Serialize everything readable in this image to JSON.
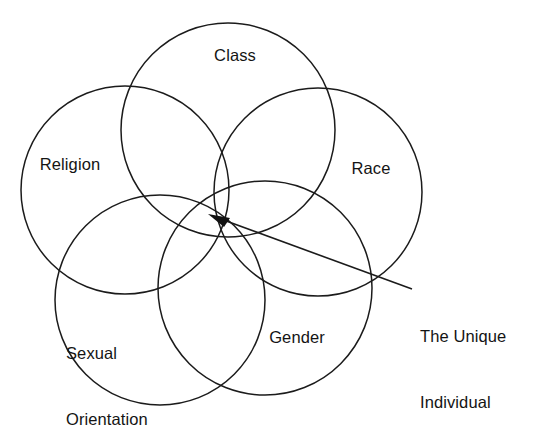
{
  "diagram": {
    "type": "venn",
    "title": "",
    "background_color": "#ffffff",
    "stroke_color": "#1b1b1b",
    "text_color": "#141414",
    "canvas": {
      "width": 549,
      "height": 426
    },
    "circles": [
      {
        "id": "religion",
        "label": "Religion",
        "cx": 125,
        "cy": 190,
        "r": 104
      },
      {
        "id": "class",
        "label": "Class",
        "cx": 228,
        "cy": 130,
        "r": 107
      },
      {
        "id": "race",
        "label": "Race",
        "cx": 318,
        "cy": 192,
        "r": 104
      },
      {
        "id": "sexual-orientation",
        "label": "Sexual\nOrientation",
        "cx": 160,
        "cy": 300,
        "r": 105
      },
      {
        "id": "gender",
        "label": "Gender",
        "cx": 265,
        "cy": 288,
        "r": 107
      }
    ],
    "labels": {
      "class": "Class",
      "religion": "Religion",
      "race": "Race",
      "gender": "Gender",
      "sexual_orientation_line1": "Sexual",
      "sexual_orientation_line2": "Orientation"
    },
    "callout": {
      "line1": "The Unique",
      "line2": "Individual",
      "arrow_tip": {
        "x": 211,
        "y": 215
      },
      "line_end": {
        "x": 412,
        "y": 289
      },
      "icon": "arrow-left-icon"
    }
  }
}
